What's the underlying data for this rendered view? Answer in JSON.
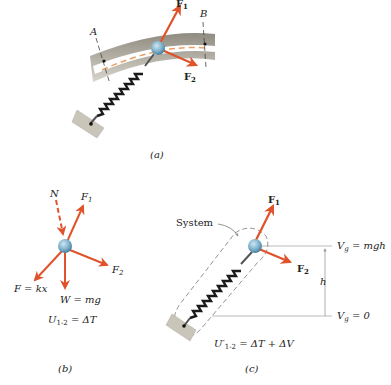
{
  "figure": {
    "panels": [
      {
        "id": "a",
        "caption": "(a)",
        "labels": {
          "A": "A",
          "B": "B",
          "F1": "F",
          "F1_sub": "1",
          "F2": "F",
          "F2_sub": "2"
        }
      },
      {
        "id": "b",
        "caption": "(b)",
        "labels": {
          "N": "N",
          "F1": "F",
          "F1_sub": "1",
          "F2": "F",
          "F2_sub": "2",
          "spring_force": "F = kx",
          "weight": "W = mg",
          "equation": "U",
          "equation_sub": "1-2",
          "equation_rhs": " = ΔT"
        }
      },
      {
        "id": "c",
        "caption": "(c)",
        "labels": {
          "system": "System",
          "F1": "F",
          "F1_sub": "1",
          "F2": "F",
          "F2_sub": "2",
          "height": "h",
          "vg_top": "V",
          "vg_top_sub": "g",
          "vg_top_rhs": " = mgh",
          "vg_bottom": "V",
          "vg_bottom_sub": "g",
          "vg_bottom_rhs": " = 0",
          "equation": "U′",
          "equation_sub": "1-2",
          "equation_rhs": " = ΔT + ΔV"
        }
      }
    ]
  },
  "colors": {
    "force": "#e0522a",
    "ball": "#7fb2cc",
    "spring": "#1a1a1a",
    "track": "#b8b4a8",
    "wall": "#c9c5b8"
  }
}
